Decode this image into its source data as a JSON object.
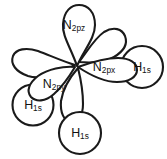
{
  "figure": {
    "background_color": "#ffffff",
    "stroke_color": "#1a1a1a",
    "fill_color": "#ffffff"
  },
  "orbitals": {
    "nitrogen": [
      {
        "id": "n-2pz",
        "element": "N",
        "subscript": "2pz",
        "label_main": "N",
        "label_sub": "2pz",
        "direction": "up",
        "label_x": 74,
        "label_y": 26
      },
      {
        "id": "n-2px",
        "element": "N",
        "subscript": "2px",
        "label_main": "N",
        "label_sub": "2px",
        "direction": "right",
        "label_x": 104,
        "label_y": 68
      },
      {
        "id": "n-2py",
        "element": "N",
        "subscript": "2py",
        "label_main": "N",
        "label_sub": "2py",
        "direction": "lower-left",
        "label_x": 54,
        "label_y": 85
      }
    ],
    "hydrogen": [
      {
        "id": "h-1s-right",
        "element": "H",
        "subscript": "1s",
        "label_main": "H",
        "label_sub": "1s",
        "cx": 142,
        "cy": 67,
        "r": 21,
        "label_x": 142,
        "label_y": 68
      },
      {
        "id": "h-1s-left",
        "element": "H",
        "subscript": "1s",
        "label_main": "H",
        "label_sub": "1s",
        "cx": 33,
        "cy": 105,
        "r": 20.5,
        "label_x": 33,
        "label_y": 106
      },
      {
        "id": "h-1s-bottom",
        "element": "H",
        "subscript": "1s",
        "label_main": "H",
        "label_sub": "1s",
        "cx": 80,
        "cy": 133,
        "r": 21,
        "label_x": 80,
        "label_y": 134
      }
    ]
  },
  "geometry": {
    "center_x": 77,
    "center_y": 65,
    "lobe_paths": {
      "pz_front": "M 77 66 C 71 48 62 36 63 24 C 64 11 71 5 79 5 C 88 5 95 12 95 25 C 95 38 84 50 77 66 Z",
      "pz_back": "M 79 62 C 88 50 95 38 104 32 C 114 26 122 29 125 36 C 128 44 124 51 114 57 C 104 63 90 63 79 62 Z",
      "px_front": "M 78 67 C 92 62 106 58 118 58 C 130 58 137 63 137 70 C 137 77 129 82 117 82 C 104 82 90 75 78 67 Z",
      "px_back": "M 75 65 C 62 61 49 55 38 51 C 26 47 16 49 13 56 C 10 64 16 72 28 76 C 41 80 60 73 75 65 Z",
      "py_front": "M 75 67 C 69 77 62 87 54 94 C 45 102 36 102 31 97 C 26 91 29 83 38 76 C 48 69 63 66 75 67 Z",
      "py_back": "M 78 68 C 81 80 83 93 83 104 C 83 116 78 123 71 122 C 64 121 60 113 61 101 C 63 88 71 76 78 68 Z"
    }
  }
}
